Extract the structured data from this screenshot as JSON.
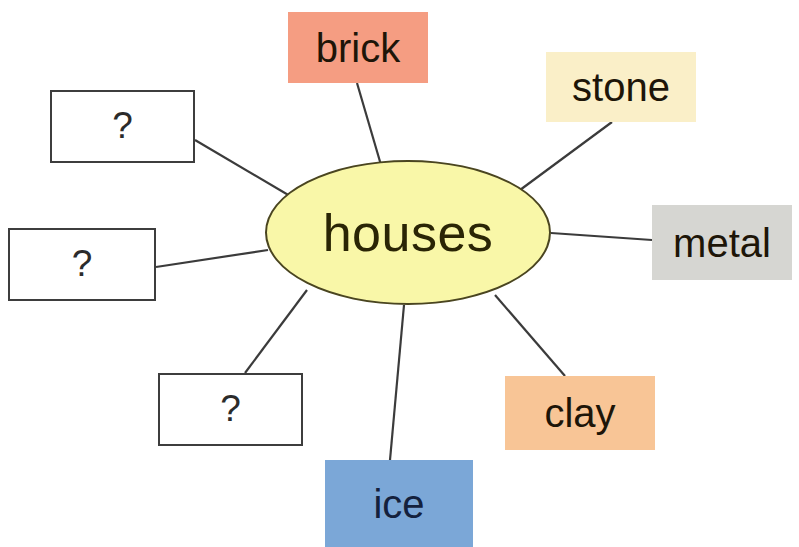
{
  "diagram": {
    "type": "concept-map",
    "title": "houses",
    "canvas": {
      "width": 799,
      "height": 547,
      "background": "#ffffff"
    },
    "center": {
      "label": "houses",
      "shape": "ellipse",
      "fill": "#f9f7a8",
      "stroke": "#4a4520",
      "x": 265,
      "y": 160,
      "width": 286,
      "height": 145
    },
    "edge_color": "#3b3b3b",
    "nodes": [
      {
        "id": "unknown-1",
        "label": "?",
        "kind": "unknown",
        "fill": "#ffffff",
        "stroke": "#3d3d3d",
        "text_color": "#2b2b2b",
        "x": 50,
        "y": 90,
        "width": 145,
        "height": 73,
        "edge_from": {
          "x": 195,
          "y": 140
        },
        "edge_to": {
          "x": 290,
          "y": 196
        }
      },
      {
        "id": "brick",
        "label": "brick",
        "kind": "material",
        "fill": "#f59d82",
        "stroke": "none",
        "text_color": "#1d1508",
        "x": 288,
        "y": 12,
        "width": 140,
        "height": 71,
        "edge_from": {
          "x": 357,
          "y": 83
        },
        "edge_to": {
          "x": 381,
          "y": 165
        }
      },
      {
        "id": "stone",
        "label": "stone",
        "kind": "material",
        "fill": "#faefc8",
        "stroke": "none",
        "text_color": "#1d1508",
        "x": 546,
        "y": 52,
        "width": 150,
        "height": 70,
        "edge_from": {
          "x": 612,
          "y": 122
        },
        "edge_to": {
          "x": 520,
          "y": 190
        }
      },
      {
        "id": "metal",
        "label": "metal",
        "kind": "material",
        "fill": "#d6d6d2",
        "stroke": "none",
        "text_color": "#1d1508",
        "x": 652,
        "y": 205,
        "width": 140,
        "height": 75,
        "edge_from": {
          "x": 652,
          "y": 240
        },
        "edge_to": {
          "x": 551,
          "y": 233
        }
      },
      {
        "id": "clay",
        "label": "clay",
        "kind": "material",
        "fill": "#f8c596",
        "stroke": "none",
        "text_color": "#1d1508",
        "x": 505,
        "y": 376,
        "width": 150,
        "height": 74,
        "edge_from": {
          "x": 565,
          "y": 376
        },
        "edge_to": {
          "x": 495,
          "y": 295
        }
      },
      {
        "id": "ice",
        "label": "ice",
        "kind": "material",
        "fill": "#7ba7d7",
        "stroke": "none",
        "text_color": "#14213d",
        "x": 325,
        "y": 460,
        "width": 148,
        "height": 87,
        "edge_from": {
          "x": 390,
          "y": 460
        },
        "edge_to": {
          "x": 404,
          "y": 305
        }
      },
      {
        "id": "unknown-3",
        "label": "?",
        "kind": "unknown",
        "fill": "#ffffff",
        "stroke": "#3d3d3d",
        "text_color": "#2b2b2b",
        "x": 158,
        "y": 373,
        "width": 145,
        "height": 73,
        "edge_from": {
          "x": 245,
          "y": 373
        },
        "edge_to": {
          "x": 307,
          "y": 290
        }
      },
      {
        "id": "unknown-2",
        "label": "?",
        "kind": "unknown",
        "fill": "#ffffff",
        "stroke": "#3d3d3d",
        "text_color": "#2b2b2b",
        "x": 8,
        "y": 228,
        "width": 148,
        "height": 73,
        "edge_from": {
          "x": 156,
          "y": 267
        },
        "edge_to": {
          "x": 268,
          "y": 250
        }
      }
    ]
  }
}
